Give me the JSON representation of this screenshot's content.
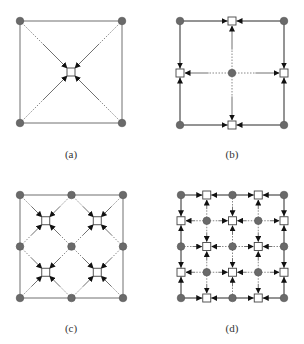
{
  "colors": {
    "line": "#707070",
    "node_fill": "#6a6a6a",
    "node_stroke": "#555555",
    "square_fill": "#ffffff",
    "square_stroke": "#444444",
    "arrow": "#111111",
    "dotted": "#888888"
  },
  "panels": [
    {
      "id": "a",
      "caption": "(a)",
      "origin": [
        20,
        21
      ],
      "size": 102,
      "grid_n": 1,
      "pattern": "diagonal"
    },
    {
      "id": "b",
      "caption": "(b)",
      "origin": [
        180,
        21
      ],
      "size": 104,
      "grid_n": 2,
      "pattern": "axis"
    },
    {
      "id": "c",
      "caption": "(c)",
      "origin": [
        20,
        195
      ],
      "size": 103,
      "grid_n": 2,
      "pattern": "diagonal"
    },
    {
      "id": "d",
      "caption": "(d)",
      "origin": [
        181,
        195
      ],
      "size": 103,
      "grid_n": 4,
      "pattern": "axis"
    }
  ]
}
